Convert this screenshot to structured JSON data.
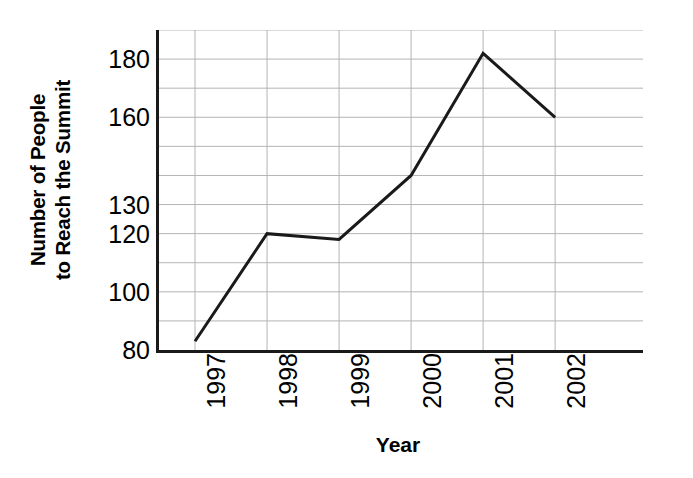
{
  "chart_data": {
    "type": "line",
    "title": "",
    "xlabel": "Year",
    "ylabel_lines": [
      "Number of People",
      "to Reach the Summit"
    ],
    "ylabel": "Number of People to Reach the Summit",
    "categories": [
      "1997",
      "1998",
      "1999",
      "2000",
      "2001",
      "2002"
    ],
    "values": [
      83,
      120,
      118,
      140,
      182,
      160
    ],
    "series": [
      {
        "name": "Number of People to Reach the Summit",
        "values": [
          83,
          120,
          118,
          140,
          182,
          160
        ]
      }
    ],
    "ylim": [
      80,
      190
    ],
    "y_tick_labels": [
      "180",
      "160",
      "130",
      "120",
      "100",
      "80"
    ],
    "y_tick_values": [
      180,
      160,
      130,
      120,
      100,
      80
    ],
    "y_gridline_values": [
      190,
      180,
      170,
      160,
      150,
      140,
      130,
      120,
      110,
      100,
      90
    ],
    "grid": true,
    "grid_color": "#b4b4b4",
    "line_color": "#1a1a1a",
    "line_width": 3,
    "axis_color": "#1a1a1a",
    "background": "#ffffff",
    "legend": null,
    "legend_position": "none",
    "x_tick_rotation": -90,
    "markers": false
  }
}
